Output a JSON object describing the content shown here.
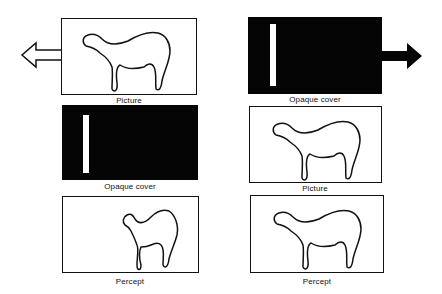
{
  "figure": {
    "left_column": {
      "description": "Left panel sequence",
      "panels": [
        {
          "type": "picture",
          "label": "Picture"
        },
        {
          "type": "opaque-cover",
          "label": "Opaque cover"
        },
        {
          "type": "percept",
          "label": "Percept"
        }
      ],
      "arrow": {
        "direction": "left",
        "style": "outline"
      }
    },
    "right_column": {
      "description": "Right panel sequence",
      "panels": [
        {
          "type": "opaque-cover",
          "label": "Opaque cover"
        },
        {
          "type": "picture",
          "label": "Picture"
        },
        {
          "type": "percept",
          "label": "Percept"
        }
      ],
      "arrow": {
        "direction": "right",
        "style": "filled"
      }
    }
  },
  "colors": {
    "ink": "#111111",
    "cover": "#050505",
    "background": "#ffffff"
  }
}
